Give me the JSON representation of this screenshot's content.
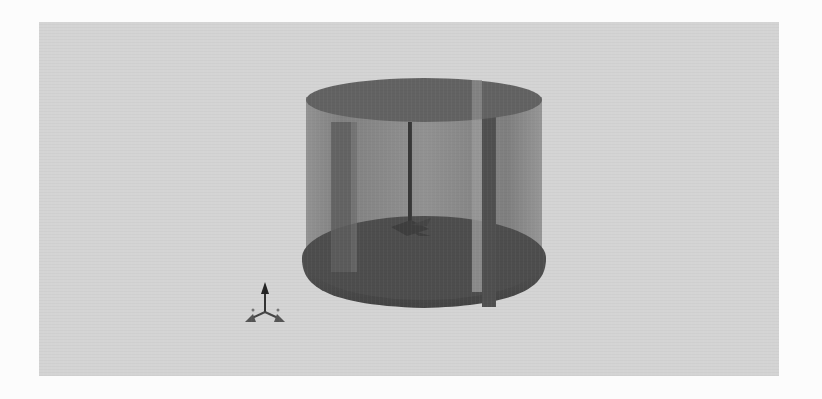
{
  "figure": {
    "background_color": "#d4d4d4",
    "page_color": "#fcfcfc",
    "tank": {
      "wall_color": "#8a8a8a",
      "top_face_color": "#606060",
      "bottom_color": "#4a4a4a",
      "baffle_color": "#555555",
      "shaft_color": "#3a3a3a",
      "baffles_visible": 3,
      "impeller_visible": true
    },
    "axis_triad": {
      "icon": "axis-triad-icon",
      "arrows": [
        "up",
        "left",
        "right"
      ],
      "color": "#3a3a3a"
    }
  }
}
